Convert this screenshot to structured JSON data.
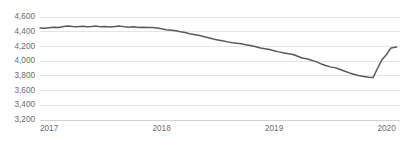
{
  "chart_data": {
    "type": "line",
    "title": "",
    "subtitle": "",
    "xlabel": "",
    "ylabel": "",
    "ylim": [
      3200,
      4600
    ],
    "xlim": [
      2017.0,
      2020.2
    ],
    "grid": true,
    "legend": false,
    "legend_position": "none",
    "line_color": "#595959",
    "grid_color": "#d9d9d9",
    "axis_color": "#bfbfbf",
    "tick_label_color": "#6b6b6b",
    "background_color": "#ffffff",
    "yticks": [
      3200,
      3400,
      3600,
      3800,
      4000,
      4200,
      4400,
      4600
    ],
    "ytick_labels": [
      "3,200",
      "3,400",
      "3,600",
      "3,800",
      "4,000",
      "4,200",
      "4,400",
      "4,600"
    ],
    "xticks": [
      2017,
      2018,
      2019,
      2020
    ],
    "xtick_labels": [
      "2017",
      "2018",
      "2019",
      "2020"
    ],
    "series": [
      {
        "name": "series-1",
        "color": "#595959",
        "x": [
          2017.0,
          2017.04,
          2017.08,
          2017.12,
          2017.17,
          2017.21,
          2017.25,
          2017.29,
          2017.33,
          2017.38,
          2017.42,
          2017.46,
          2017.5,
          2017.54,
          2017.58,
          2017.62,
          2017.67,
          2017.71,
          2017.75,
          2017.79,
          2017.83,
          2017.88,
          2017.92,
          2017.96,
          2018.0,
          2018.04,
          2018.08,
          2018.12,
          2018.17,
          2018.21,
          2018.25,
          2018.29,
          2018.33,
          2018.38,
          2018.42,
          2018.46,
          2018.5,
          2018.54,
          2018.58,
          2018.62,
          2018.67,
          2018.71,
          2018.75,
          2018.79,
          2018.83,
          2018.88,
          2018.92,
          2018.96,
          2019.0,
          2019.04,
          2019.08,
          2019.12,
          2019.17,
          2019.21,
          2019.25,
          2019.29,
          2019.33,
          2019.38,
          2019.42,
          2019.46,
          2019.5,
          2019.54,
          2019.58,
          2019.62,
          2019.67,
          2019.71,
          2019.75,
          2019.79,
          2019.83,
          2019.88,
          2019.92,
          2019.96,
          2020.0,
          2020.04,
          2020.08,
          2020.12,
          2020.17
        ],
        "values": [
          4452,
          4448,
          4455,
          4462,
          4458,
          4470,
          4478,
          4472,
          4468,
          4474,
          4466,
          4470,
          4476,
          4468,
          4472,
          4464,
          4470,
          4476,
          4466,
          4460,
          4468,
          4458,
          4462,
          4456,
          4458,
          4452,
          4440,
          4428,
          4420,
          4412,
          4398,
          4388,
          4372,
          4360,
          4348,
          4332,
          4318,
          4300,
          4288,
          4276,
          4262,
          4250,
          4242,
          4236,
          4224,
          4208,
          4196,
          4180,
          4170,
          4158,
          4142,
          4126,
          4112,
          4100,
          4090,
          4066,
          4042,
          4028,
          4010,
          3990,
          3962,
          3940,
          3922,
          3912,
          3886,
          3862,
          3840,
          3822,
          3806,
          3792,
          3782,
          3776,
          3900,
          4020,
          4090,
          4180,
          4192
        ]
      }
    ]
  }
}
